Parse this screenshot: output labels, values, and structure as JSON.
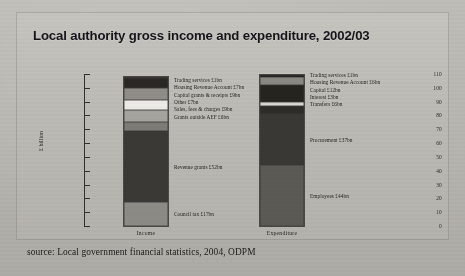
{
  "figure": {
    "title": "Local authority gross income and expenditure, 2002/03",
    "source": "source: Local government financial statistics, 2004, ODPM"
  },
  "chart_data": {
    "type": "bar",
    "title": "Local authority gross income and expenditure, 2002/03",
    "xlabel": "",
    "ylabel": "£ billion",
    "ylim": [
      0,
      110
    ],
    "yticks": [
      0,
      10,
      20,
      30,
      40,
      50,
      60,
      70,
      80,
      90,
      100,
      110
    ],
    "grid": false,
    "legend_position": "inline-labels",
    "stacked": true,
    "categories": [
      "Income",
      "Expenditure"
    ],
    "series": [
      {
        "name": "Income",
        "total": 108,
        "segments": [
          {
            "label": "Council tax £17bn",
            "name": "Council tax",
            "value": 17,
            "color": "#8d8b85"
          },
          {
            "label": "Revenue grants £52bn",
            "name": "Revenue grants",
            "value": 52,
            "color": "#3b3936"
          },
          {
            "label": "Grants outside AEF £6bn",
            "name": "Grants outside AEF",
            "value": 6,
            "color": "#7e7c77"
          },
          {
            "label": "Sales, fees & charges £9bn",
            "name": "Sales, fees & charges",
            "value": 9,
            "color": "#a6a49e"
          },
          {
            "label": "Other £7bn",
            "name": "Other",
            "value": 7,
            "color": "#ecebe7"
          },
          {
            "label": "Capital grants & receipts £9bn",
            "name": "Capital grants & receipts",
            "value": 9,
            "color": "#8f8d87"
          },
          {
            "label": "Housing Revenue Account £7bn",
            "name": "Housing Revenue Account",
            "value": 7,
            "color": "#2a2825"
          },
          {
            "label": "Trading services £1bn",
            "name": "Trading services",
            "value": 1,
            "color": "#1d1b19"
          }
        ]
      },
      {
        "name": "Expenditure",
        "total": 109,
        "segments": [
          {
            "label": "Employees £44bn",
            "name": "Employees",
            "value": 44,
            "color": "#5c5a55"
          },
          {
            "label": "Procurement £37bn",
            "name": "Procurement",
            "value": 37,
            "color": "#3a3835"
          },
          {
            "label": "Transfers £6bn",
            "name": "Transfers",
            "value": 6,
            "color": "#2e2c29"
          },
          {
            "label": "Interest £3bn",
            "name": "Interest",
            "value": 3,
            "color": "#d9d7d2"
          },
          {
            "label": "Capital £12bn",
            "name": "Capital",
            "value": 12,
            "color": "#26241f"
          },
          {
            "label": "Housing Revenue Account £6bn",
            "name": "Housing Revenue Account",
            "value": 6,
            "color": "#8a8882"
          },
          {
            "label": "Trading services £1bn",
            "name": "Trading services",
            "value": 1,
            "color": "#1d1b19"
          }
        ]
      }
    ],
    "income_legend_lines": [
      "Trading services £1bn",
      "Housing Revenue Account £7bn",
      "Capital grants & receipts £9bn",
      "Other £7bn",
      "Sales, fees & charges £9bn",
      "Grants outside AEF £6bn"
    ],
    "expenditure_legend_lines": [
      "Trading services £1bn",
      "Housing Revenue Account £6bn",
      "Capital £12bn",
      "Interest £3bn",
      "Transfers £6bn"
    ]
  }
}
